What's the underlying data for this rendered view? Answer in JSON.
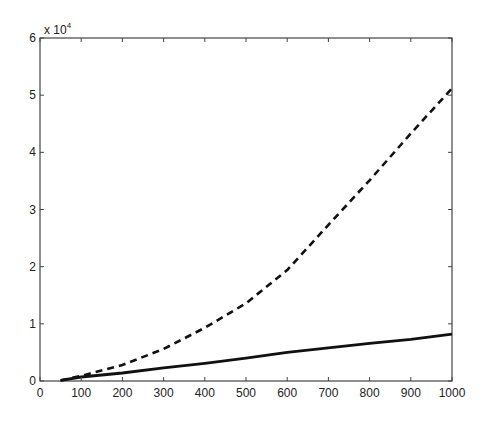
{
  "chart_data": {
    "type": "line",
    "title": "",
    "xlabel": "",
    "ylabel": "",
    "y_multiplier_label": "x 10",
    "y_multiplier_exponent": "4",
    "xlim": [
      0,
      1000
    ],
    "ylim": [
      0,
      6
    ],
    "y_scale": 10000,
    "grid": false,
    "legend": null,
    "x_ticks": [
      0,
      100,
      200,
      300,
      400,
      500,
      600,
      700,
      800,
      900,
      1000
    ],
    "x_tick_labels": [
      "0",
      "100",
      "200",
      "300",
      "400",
      "500",
      "600",
      "700",
      "800",
      "900",
      "1000"
    ],
    "y_ticks": [
      0,
      1,
      2,
      3,
      4,
      5,
      6
    ],
    "y_tick_labels": [
      "0",
      "1",
      "2",
      "3",
      "4",
      "5",
      "6"
    ],
    "x": [
      50,
      100,
      200,
      300,
      400,
      500,
      600,
      700,
      800,
      900,
      1000
    ],
    "series": [
      {
        "name": "dashed",
        "style": "dashed",
        "color": "#111111",
        "values": [
          0.01,
          0.09,
          0.28,
          0.56,
          0.93,
          1.36,
          1.94,
          2.73,
          3.51,
          4.33,
          5.12
        ]
      },
      {
        "name": "solid",
        "style": "solid",
        "color": "#111111",
        "values": [
          0.01,
          0.07,
          0.14,
          0.23,
          0.31,
          0.4,
          0.5,
          0.58,
          0.66,
          0.73,
          0.82
        ]
      }
    ]
  }
}
